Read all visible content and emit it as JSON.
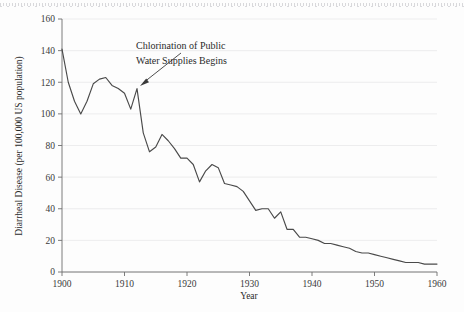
{
  "chart_data": {
    "type": "line",
    "title": "",
    "xlabel": "Year",
    "ylabel": "Diarrheal Disease (per 100,000 US population)",
    "xlim": [
      1900,
      1960
    ],
    "ylim": [
      0,
      160
    ],
    "xticks": [
      1900,
      1910,
      1920,
      1930,
      1940,
      1950,
      1960
    ],
    "xticklabels": [
      "1900",
      "1910",
      "1920",
      "1930",
      "1940",
      "1950",
      "1960"
    ],
    "yticks": [
      0,
      20,
      40,
      60,
      80,
      100,
      120,
      140,
      160
    ],
    "yticklabels": [
      "0",
      "20",
      "40",
      "60",
      "80",
      "100",
      "120",
      "140",
      "160"
    ],
    "grid": "horizontal",
    "legend": "none",
    "line_color": "#4a4a4a",
    "series": [
      {
        "name": "Diarrheal disease death rate",
        "x": [
          1900,
          1901,
          1902,
          1903,
          1904,
          1905,
          1906,
          1907,
          1908,
          1909,
          1910,
          1911,
          1912,
          1913,
          1914,
          1915,
          1916,
          1917,
          1918,
          1919,
          1920,
          1921,
          1922,
          1923,
          1924,
          1925,
          1926,
          1927,
          1928,
          1929,
          1930,
          1931,
          1932,
          1933,
          1934,
          1935,
          1936,
          1937,
          1938,
          1939,
          1940,
          1941,
          1942,
          1943,
          1944,
          1945,
          1946,
          1947,
          1948,
          1949,
          1950,
          1951,
          1952,
          1953,
          1954,
          1955,
          1956,
          1957,
          1958,
          1959,
          1960
        ],
        "values": [
          141,
          120,
          108,
          100,
          108,
          119,
          122,
          123,
          118,
          116,
          113,
          103,
          116,
          88,
          76,
          79,
          87,
          83,
          78,
          72,
          72,
          68,
          57,
          64,
          68,
          66,
          56,
          55,
          54,
          51,
          45,
          39,
          40,
          40,
          34,
          38,
          27,
          27,
          22,
          22,
          21,
          20,
          18,
          18,
          17,
          16,
          15,
          13,
          12,
          12,
          11,
          10,
          9,
          8,
          7,
          6,
          6,
          6,
          5,
          5,
          5
        ]
      }
    ],
    "annotations": [
      {
        "name": "chlorination-annotation",
        "line1": "Chlorination of Public",
        "line2": "Water Supplies Begins",
        "points_to_year": 1910,
        "points_to_value": 113
      }
    ]
  }
}
